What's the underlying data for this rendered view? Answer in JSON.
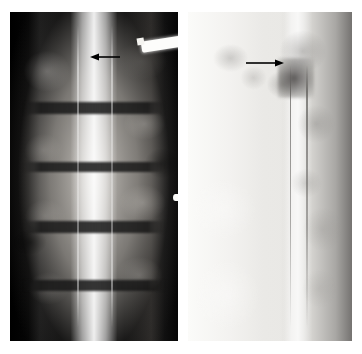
{
  "figure": {
    "kind": "radiograph-figure",
    "panel_count": 2,
    "background_color": "#ffffff",
    "width_px": 362,
    "height_px": 354
  },
  "panels": [
    {
      "id": "ap",
      "name": "anteroposterior-myelogram",
      "label": "",
      "view": "AP",
      "x": 10,
      "y": 12,
      "width": 168,
      "height": 329,
      "tone": "high-contrast-dark",
      "background_color": "#0a0a0a",
      "features": {
        "contrast_column": "bright vertical midline dye column",
        "disc_spaces": 4,
        "instrument": "bright white wedge-shaped needle entering upper right",
        "edge_marker": "small bright notch on right margin"
      },
      "annotation": {
        "name": "arrow-annotation",
        "type": "arrow",
        "direction": "left",
        "color": "#000000",
        "tip_x": 92,
        "tip_y": 57,
        "tail_x": 118,
        "tail_y": 57,
        "length_px": 28
      }
    },
    {
      "id": "lateral",
      "name": "lateral-myelogram",
      "label": "",
      "view": "Lateral",
      "x": 188,
      "y": 12,
      "width": 164,
      "height": 329,
      "tone": "pale-washed-out",
      "background_color": "#efeeec",
      "features": {
        "contrast_column": "narrow vertical dye column right of midline",
        "defect": "dark indentation of the contrast column at the arrow level",
        "posterior_elements": "darker density along right margin"
      },
      "annotation": {
        "name": "arrow-annotation",
        "type": "arrow",
        "direction": "right",
        "color": "#000000",
        "tip_x": 283,
        "tip_y": 63,
        "tail_x": 248,
        "tail_y": 63,
        "length_px": 36
      }
    }
  ],
  "colors": {
    "page_background": "#ffffff",
    "annotation": "#000000",
    "ap_film_base": "#0a0a0a",
    "lateral_film_base": "#e9e8e5",
    "contrast_dye": "#ffffff",
    "instrument": "#fdfdfb"
  }
}
